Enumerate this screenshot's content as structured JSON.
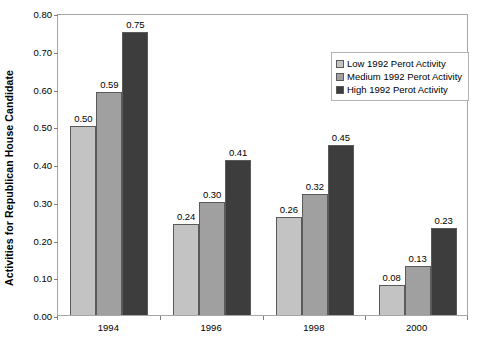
{
  "chart_data": {
    "type": "bar",
    "title": "",
    "xlabel": "",
    "ylabel": "Activities for Republican House Candidate",
    "categories": [
      "1994",
      "1996",
      "1998",
      "2000"
    ],
    "series": [
      {
        "name": "Low 1992 Perot Activity",
        "color": "#c3c3c3",
        "values": [
          0.5,
          0.24,
          0.26,
          0.08
        ],
        "labels": [
          "0.50",
          "0.24",
          "0.26",
          "0.08"
        ]
      },
      {
        "name": "Medium 1992 Perot Activity",
        "color": "#a0a0a0",
        "values": [
          0.59,
          0.3,
          0.32,
          0.13
        ],
        "labels": [
          "0.59",
          "0.30",
          "0.32",
          "0.13"
        ]
      },
      {
        "name": "High 1992 Perot Activity",
        "color": "#3d3d3d",
        "values": [
          0.75,
          0.41,
          0.45,
          0.23
        ],
        "labels": [
          "0.75",
          "0.41",
          "0.45",
          "0.23"
        ]
      }
    ],
    "ylim": [
      0.0,
      0.8
    ],
    "ytick_step": 0.1,
    "ytick_labels": [
      "0.80",
      "0.70",
      "0.60",
      "0.50",
      "0.40",
      "0.30",
      "0.20",
      "0.10",
      "0.00"
    ],
    "ytick_values": [
      0.8,
      0.7,
      0.6,
      0.5,
      0.4,
      0.3,
      0.2,
      0.1,
      0.0
    ],
    "grid": false,
    "legend_position": "top-right",
    "plot_border_color": "#a6a6a6",
    "background_color": "#ffffff"
  }
}
